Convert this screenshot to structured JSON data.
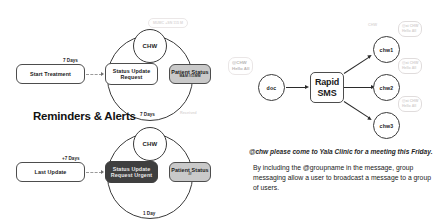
{
  "slide": {
    "section_heading": "Reminders & Alerts"
  },
  "flow_top": {
    "start_node": "Start Treatment",
    "request_node_line1": "Status Update",
    "request_node_line2": "Request",
    "status_node_line1": "Patient Status",
    "status_node_sub": "MAM //11MM",
    "chw_circle": "CHW",
    "edge_start_to_request": "7 Days",
    "edge_loop_bottom": "7 Days",
    "edge_received": "Received",
    "watermark_top": "MUMC +SN 115 M"
  },
  "flow_bottom": {
    "start_node": "Last Update",
    "request_node_line1": "Status Update",
    "request_node_line2": "Request Urgent",
    "status_node_line1": "Patient Status",
    "status_node_sub": "///",
    "chw_circle": "CHW",
    "edge_start_to_request": "+7 Days",
    "edge_loop_bottom": "1 Day"
  },
  "sms_diagram": {
    "sender_node": "doc",
    "hub_line1": "Rapid",
    "hub_line2": "SMS",
    "recipients": [
      "chw1",
      "chw2",
      "chw3"
    ],
    "sender_bubble_line1": "@CHW",
    "sender_bubble_line2": "Hello All",
    "recipient_bubbles": [
      {
        "line1": "@at CHW",
        "line2": "Hello All"
      },
      {
        "line1": "@at CHW",
        "line2": "Hello All"
      },
      {
        "line1": "@at CHW",
        "line2": "Hello All"
      }
    ],
    "chw_watermark": "CHW"
  },
  "caption": {
    "italic_line": "@chw please come to Yala Clinic for a meeting this Friday.",
    "body": "By including the @groupname in the message, group messaging allow a user to broadcast a message to a group of users."
  },
  "colors": {
    "gray_node": "#c9c9c9",
    "dark_node": "#3f3f3f",
    "stroke": "#3a3a3a",
    "faint_text": "#dcd8d8"
  }
}
